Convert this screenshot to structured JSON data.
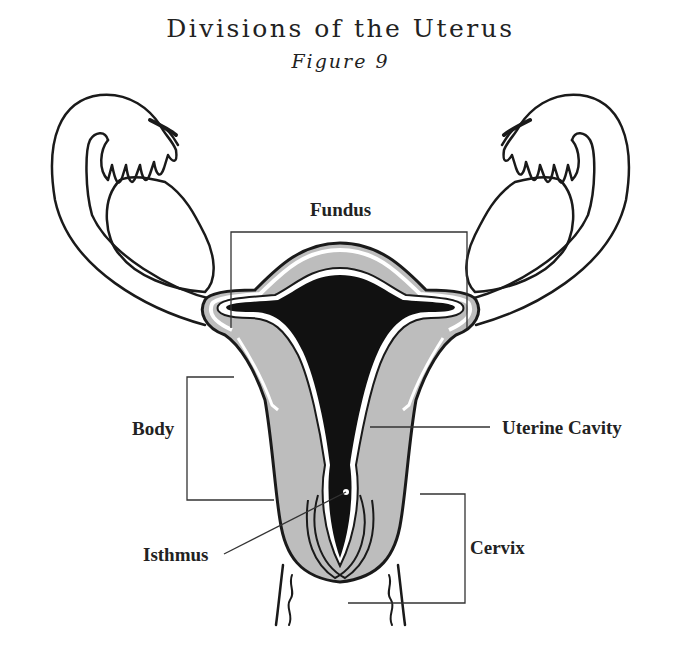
{
  "figure": {
    "title": "Divisions of the Uterus",
    "subtitle": "Figure 9"
  },
  "labels": {
    "fundus": "Fundus",
    "body": "Body",
    "uterine_cavity": "Uterine Cavity",
    "isthmus": "Isthmus",
    "cervix": "Cervix"
  },
  "colors": {
    "outline": "#1a1a1a",
    "myometrium": "#bdbdbd",
    "cavity": "#111111",
    "background": "#ffffff"
  }
}
